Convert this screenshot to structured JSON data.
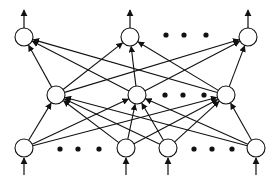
{
  "diagram": {
    "type": "feedforward-neural-network",
    "stroke_color": "#111111",
    "fill_color": "#ffffff",
    "node_radius": 9,
    "layers": [
      {
        "name": "output",
        "nodes": [
          {
            "x": 24,
            "y": 37
          },
          {
            "x": 130,
            "y": 37
          },
          {
            "x": 248,
            "y": 37
          }
        ],
        "ellipsis": [
          {
            "x": 166,
            "y": 35
          },
          {
            "x": 184,
            "y": 35
          },
          {
            "x": 206,
            "y": 35
          }
        ]
      },
      {
        "name": "hidden",
        "nodes": [
          {
            "x": 56,
            "y": 95
          },
          {
            "x": 137,
            "y": 95
          },
          {
            "x": 226,
            "y": 95
          }
        ],
        "ellipsis": [
          {
            "x": 165,
            "y": 95
          },
          {
            "x": 183,
            "y": 95
          },
          {
            "x": 204,
            "y": 95
          }
        ]
      },
      {
        "name": "input",
        "nodes": [
          {
            "x": 24,
            "y": 148
          },
          {
            "x": 126,
            "y": 148
          },
          {
            "x": 168,
            "y": 148
          },
          {
            "x": 256,
            "y": 148
          }
        ],
        "ellipsis": [
          {
            "x": 60,
            "y": 149
          },
          {
            "x": 78,
            "y": 149
          },
          {
            "x": 99,
            "y": 149
          },
          {
            "x": 194,
            "y": 149
          },
          {
            "x": 212,
            "y": 149
          },
          {
            "x": 232,
            "y": 149
          }
        ]
      }
    ],
    "connections": "fully-connected between adjacent layers",
    "input_arrows": "one upward arrow into each input node",
    "output_arrows": "one upward arrow out of each output node"
  }
}
